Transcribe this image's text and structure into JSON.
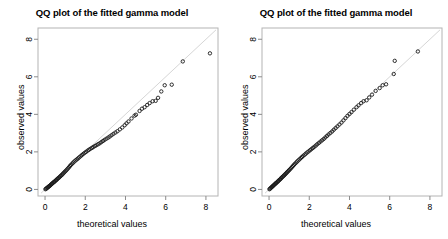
{
  "figure": {
    "background": "#ffffff",
    "panel_count": 2
  },
  "panels": [
    {
      "id": "left",
      "title": "QQ plot of the fitted gamma model",
      "xlabel": "theoretical values",
      "ylabel": "observed values"
    },
    {
      "id": "right",
      "title": "QQ plot of the fitted gamma model",
      "xlabel": "theoretical values",
      "ylabel": "observed values"
    }
  ],
  "chart_data": [
    {
      "type": "scatter",
      "panel": "left",
      "title": "QQ plot of the fitted gamma model",
      "xlabel": "theoretical values",
      "ylabel": "observed values",
      "xlim": [
        -0.35,
        8.6
      ],
      "ylim": [
        -0.35,
        8.6
      ],
      "xticks": [
        0,
        2,
        4,
        6,
        8
      ],
      "yticks": [
        0,
        2,
        4,
        6,
        8
      ],
      "xticklabels": [
        "0",
        "2",
        "4",
        "6",
        "8"
      ],
      "yticklabels": [
        "0",
        "2",
        "4",
        "6",
        "8"
      ],
      "grid": false,
      "legend": null,
      "point_color": "#1a1a1a",
      "point_marker": "open-circle",
      "reference_line": {
        "name": "identity line y = x",
        "color": "#d6d6d6",
        "x": [
          -0.2,
          8.5
        ],
        "y": [
          -0.2,
          8.5
        ]
      },
      "x": [
        0.02,
        0.05,
        0.08,
        0.11,
        0.14,
        0.17,
        0.2,
        0.23,
        0.26,
        0.29,
        0.32,
        0.35,
        0.38,
        0.42,
        0.45,
        0.48,
        0.52,
        0.55,
        0.59,
        0.62,
        0.66,
        0.7,
        0.74,
        0.78,
        0.82,
        0.86,
        0.9,
        0.95,
        0.99,
        1.04,
        1.09,
        1.14,
        1.19,
        1.24,
        1.29,
        1.35,
        1.4,
        1.46,
        1.52,
        1.58,
        1.64,
        1.7,
        1.77,
        1.83,
        1.9,
        1.97,
        2.04,
        2.11,
        2.18,
        2.25,
        2.33,
        2.4,
        2.48,
        2.56,
        2.64,
        2.72,
        2.8,
        2.88,
        2.96,
        3.05,
        3.14,
        3.22,
        3.31,
        3.4,
        3.5,
        3.6,
        3.72,
        3.84,
        3.96,
        4.05,
        4.15,
        4.3,
        4.45,
        4.52,
        4.7,
        4.82,
        4.95,
        5.08,
        5.2,
        5.35,
        5.5,
        5.62,
        5.78,
        5.95,
        6.3,
        6.85,
        8.2
      ],
      "y": [
        0.01,
        0.04,
        0.06,
        0.09,
        0.11,
        0.14,
        0.17,
        0.19,
        0.22,
        0.25,
        0.28,
        0.31,
        0.34,
        0.37,
        0.4,
        0.43,
        0.46,
        0.5,
        0.53,
        0.57,
        0.6,
        0.64,
        0.68,
        0.72,
        0.76,
        0.8,
        0.85,
        0.9,
        0.95,
        1.0,
        1.06,
        1.12,
        1.18,
        1.25,
        1.31,
        1.37,
        1.43,
        1.49,
        1.55,
        1.6,
        1.65,
        1.71,
        1.77,
        1.83,
        1.89,
        1.95,
        2.0,
        2.06,
        2.11,
        2.16,
        2.21,
        2.26,
        2.31,
        2.36,
        2.41,
        2.46,
        2.52,
        2.58,
        2.64,
        2.7,
        2.76,
        2.82,
        2.89,
        2.96,
        3.03,
        3.1,
        3.2,
        3.3,
        3.42,
        3.52,
        3.62,
        3.78,
        3.93,
        3.98,
        4.18,
        4.3,
        4.38,
        4.5,
        4.6,
        4.7,
        4.72,
        4.88,
        5.22,
        5.55,
        5.58,
        6.82,
        7.25
      ],
      "annotation": "Points fall slightly below the identity line in the upper tail."
    },
    {
      "type": "scatter",
      "panel": "right",
      "title": "QQ plot of the fitted gamma model",
      "xlabel": "theoretical values",
      "ylabel": "observed values",
      "xlim": [
        -0.35,
        8.6
      ],
      "ylim": [
        -0.35,
        8.6
      ],
      "xticks": [
        0,
        2,
        4,
        6,
        8
      ],
      "yticks": [
        0,
        2,
        4,
        6,
        8
      ],
      "xticklabels": [
        "0",
        "2",
        "4",
        "6",
        "8"
      ],
      "yticklabels": [
        "0",
        "2",
        "4",
        "6",
        "8"
      ],
      "grid": false,
      "legend": null,
      "point_color": "#1a1a1a",
      "point_marker": "open-circle",
      "reference_line": {
        "name": "identity line y = x",
        "color": "#d6d6d6",
        "x": [
          -0.2,
          8.5
        ],
        "y": [
          -0.2,
          8.5
        ]
      },
      "x": [
        0.02,
        0.05,
        0.08,
        0.11,
        0.14,
        0.17,
        0.2,
        0.23,
        0.26,
        0.29,
        0.32,
        0.35,
        0.38,
        0.42,
        0.45,
        0.48,
        0.52,
        0.55,
        0.59,
        0.62,
        0.66,
        0.7,
        0.74,
        0.78,
        0.82,
        0.86,
        0.9,
        0.95,
        0.99,
        1.04,
        1.09,
        1.14,
        1.19,
        1.24,
        1.29,
        1.35,
        1.4,
        1.46,
        1.52,
        1.58,
        1.64,
        1.7,
        1.77,
        1.83,
        1.9,
        1.97,
        2.04,
        2.11,
        2.18,
        2.25,
        2.33,
        2.4,
        2.48,
        2.56,
        2.64,
        2.72,
        2.8,
        2.88,
        2.96,
        3.05,
        3.14,
        3.22,
        3.31,
        3.4,
        3.5,
        3.6,
        3.7,
        3.8,
        3.9,
        4.0,
        4.1,
        4.22,
        4.35,
        4.45,
        4.58,
        4.7,
        4.85,
        4.98,
        5.12,
        5.3,
        5.5,
        5.65,
        5.82,
        6.2,
        6.25,
        7.4
      ],
      "y": [
        0.01,
        0.04,
        0.07,
        0.1,
        0.13,
        0.16,
        0.19,
        0.22,
        0.25,
        0.28,
        0.31,
        0.34,
        0.37,
        0.4,
        0.44,
        0.47,
        0.51,
        0.54,
        0.58,
        0.62,
        0.66,
        0.7,
        0.74,
        0.78,
        0.83,
        0.87,
        0.92,
        0.97,
        1.02,
        1.07,
        1.13,
        1.19,
        1.25,
        1.31,
        1.37,
        1.43,
        1.49,
        1.55,
        1.61,
        1.67,
        1.73,
        1.79,
        1.85,
        1.91,
        1.97,
        2.03,
        2.09,
        2.15,
        2.21,
        2.27,
        2.34,
        2.41,
        2.48,
        2.55,
        2.62,
        2.69,
        2.77,
        2.85,
        2.93,
        3.01,
        3.09,
        3.18,
        3.27,
        3.36,
        3.46,
        3.56,
        3.68,
        3.8,
        3.92,
        4.02,
        4.12,
        4.25,
        4.38,
        4.48,
        4.6,
        4.7,
        4.75,
        4.9,
        5.05,
        5.25,
        5.4,
        5.55,
        5.6,
        6.15,
        6.85,
        7.35
      ],
      "annotation": "Points lie close to the identity line throughout the range."
    }
  ]
}
